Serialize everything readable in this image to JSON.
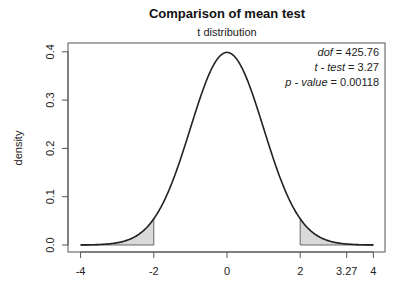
{
  "chart_data": {
    "type": "line",
    "title": "Comparison of mean test",
    "subtitle": "t distribution",
    "xlabel": "",
    "ylabel": "density",
    "xlim": [
      -4,
      4
    ],
    "ylim": [
      0,
      0.4
    ],
    "x_ticks": [
      -4,
      -2,
      0,
      2,
      3.27,
      4
    ],
    "x_tick_labels": [
      "-4",
      "-2",
      "0",
      "2",
      "3.27",
      "4"
    ],
    "y_ticks": [
      0.0,
      0.1,
      0.2,
      0.3,
      0.4
    ],
    "y_tick_labels": [
      "0.0",
      "0.1",
      "0.2",
      "0.3",
      "0.4"
    ],
    "grid": false,
    "series": [
      {
        "name": "t density (dof = 425.76)",
        "x": [
          -4,
          -3.5,
          -3,
          -2.5,
          -2,
          -1.5,
          -1,
          -0.5,
          0,
          0.5,
          1,
          1.5,
          2,
          2.5,
          3,
          3.5,
          4
        ],
        "values": [
          0.0001,
          0.0009,
          0.0045,
          0.0176,
          0.0542,
          0.1296,
          0.242,
          0.3521,
          0.3989,
          0.3521,
          0.242,
          0.1296,
          0.0542,
          0.0176,
          0.0045,
          0.0009,
          0.0001
        ]
      }
    ],
    "shaded_regions": [
      {
        "from": -4,
        "to": -2,
        "color": "#d9d9d9"
      },
      {
        "from": 2,
        "to": 4,
        "color": "#d9d9d9"
      }
    ],
    "annotations": [
      {
        "label": "dof",
        "value": "425.76"
      },
      {
        "label": "t - test",
        "value": "3.27"
      },
      {
        "label": "p - value",
        "value": "0.00118"
      }
    ],
    "dof": 425.76
  },
  "labels": {
    "title": "Comparison of mean test",
    "subtitle": "t distribution",
    "ylabel": "density",
    "ann_dof_label": "dof",
    "ann_dof_value": " = 425.76",
    "ann_t_label": "t - test",
    "ann_t_value": " = 3.27",
    "ann_p_label": "p - value",
    "ann_p_value": " = 0.00118"
  },
  "colors": {
    "curve": "#222222",
    "shade": "#d9d9d9",
    "axis": "#555555"
  }
}
